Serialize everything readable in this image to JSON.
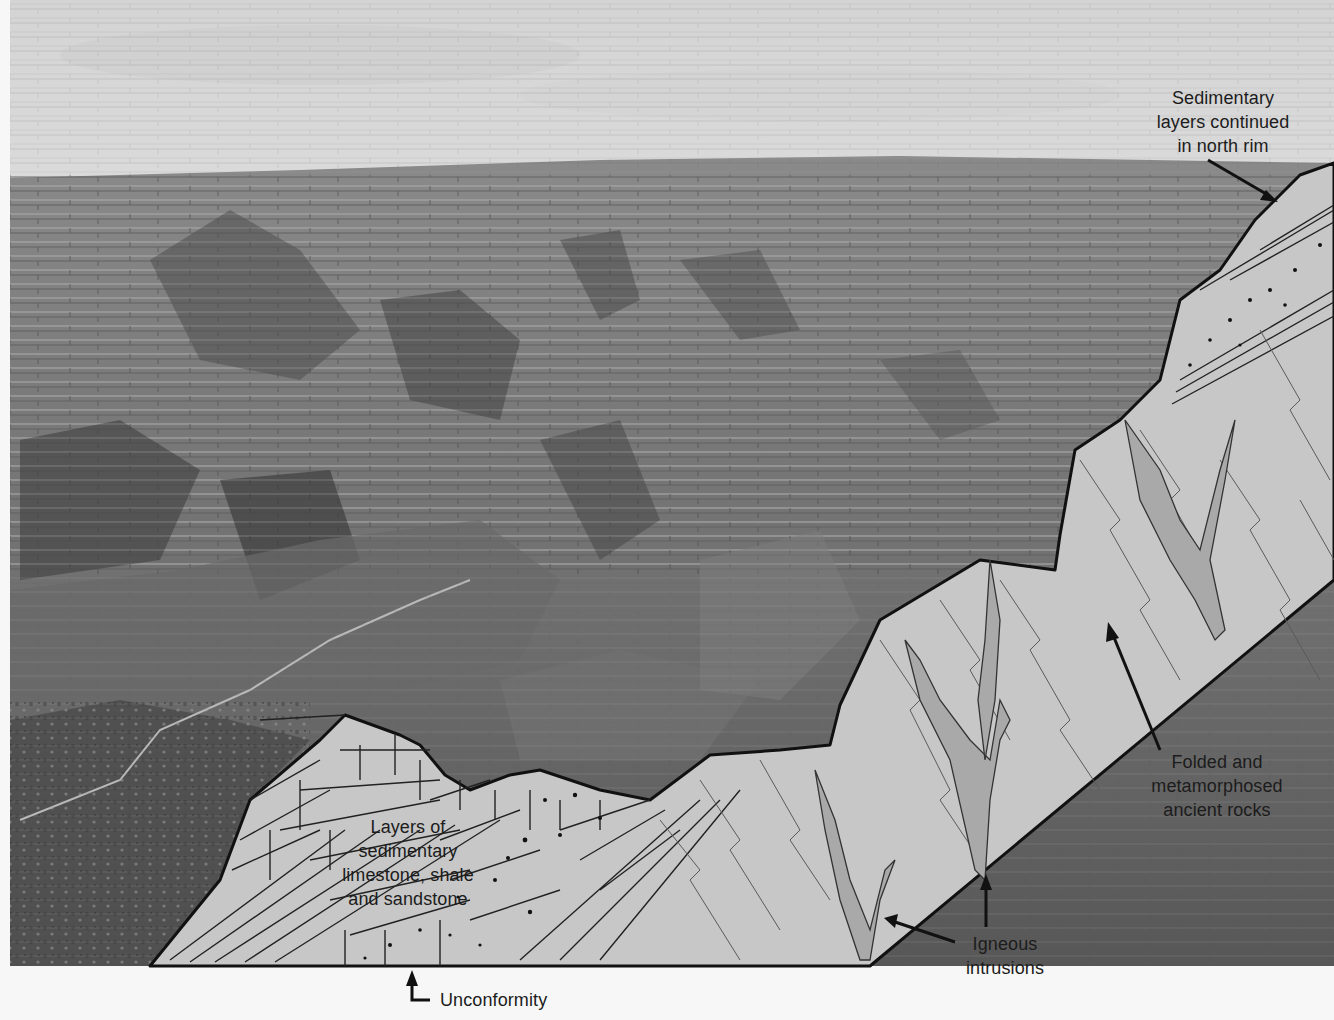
{
  "figure": {
    "colors": {
      "sky": "#e2e2e2",
      "cross_section_fill": "#c8c8c8",
      "intrusion_fill": "#a9a9a9",
      "outline": "#111111",
      "label_text": "#1c1c1c",
      "background": "#f7f7f7"
    }
  },
  "labels": {
    "north_rim": {
      "lines": [
        "Sedimentary",
        "layers continued",
        "in north rim"
      ]
    },
    "sedimentary": {
      "lines": [
        "Layers of",
        "sedimentary",
        "limestone, shale",
        "and sandstone"
      ]
    },
    "unconformity": {
      "text": "Unconformity"
    },
    "igneous": {
      "lines": [
        "Igneous",
        "intrusions"
      ]
    },
    "metamorphic": {
      "lines": [
        "Folded and",
        "metamorphosed",
        "ancient rocks"
      ]
    }
  }
}
